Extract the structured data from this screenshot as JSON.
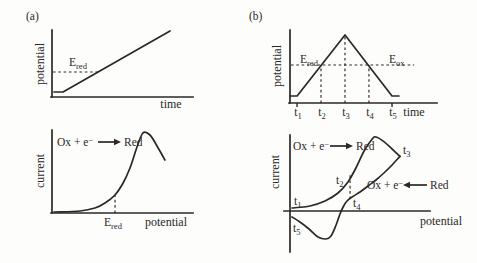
{
  "figure": {
    "panel_a_label": "(a)",
    "panel_b_label": "(b)"
  },
  "colors": {
    "ink": "#2b2826",
    "background": "#fdfdfb"
  },
  "chart_data": [
    {
      "id": "a_top",
      "type": "line",
      "title": "",
      "xlabel": "time",
      "ylabel": "potential",
      "qualitative_axes": true,
      "annotations": {
        "e_red": {
          "base": "E",
          "sub": "red"
        }
      },
      "series": [
        {
          "name": "applied-potential-ramp",
          "smooth": false,
          "x": [
            0.014,
            0.078,
            0.837
          ],
          "y": [
            0.076,
            0.076,
            1.0
          ]
        }
      ],
      "guides": [
        {
          "name": "e-red-level-dashed-line",
          "type": "h",
          "dash": true,
          "y": 0.379,
          "x0": 0.007,
          "x1": 0.326
        }
      ]
    },
    {
      "id": "a_bottom",
      "type": "line",
      "title": "",
      "xlabel": "potential",
      "ylabel": "current",
      "qualitative_axes": true,
      "annotations": {
        "e_red": {
          "base": "E",
          "sub": "red"
        }
      },
      "reaction": {
        "left": "Ox + e",
        "sup": "−",
        "right": "Red",
        "direction": "→"
      },
      "series": [
        {
          "name": "reduction-current-wave",
          "smooth": true,
          "x": [
            0.014,
            0.199,
            0.305,
            0.376,
            0.447,
            0.504,
            0.553,
            0.603,
            0.645,
            0.695,
            0.745,
            0.801
          ],
          "y": [
            0.012,
            0.024,
            0.06,
            0.12,
            0.217,
            0.361,
            0.542,
            0.795,
            0.964,
            0.94,
            0.807,
            0.639
          ]
        }
      ],
      "guides": [
        {
          "name": "e-red-dashed-marker",
          "type": "v",
          "dash": true,
          "x": 0.447,
          "y0": 0.0,
          "y1": 0.217
        }
      ]
    },
    {
      "id": "b_top",
      "type": "line",
      "title": "",
      "xlabel": "time",
      "ylabel": "potential",
      "qualitative_axes": true,
      "annotations": {
        "e_red": {
          "base": "E",
          "sub": "red"
        },
        "e_ox": {
          "base": "E",
          "sub": "ox"
        }
      },
      "x_tick_labels": [
        {
          "base": "t",
          "sub": "1"
        },
        {
          "base": "t",
          "sub": "2"
        },
        {
          "base": "t",
          "sub": "3"
        },
        {
          "base": "t",
          "sub": "4"
        },
        {
          "base": "t",
          "sub": "5"
        }
      ],
      "x_tick_positions": [
        0.048,
        0.211,
        0.374,
        0.537,
        0.694
      ],
      "series": [
        {
          "name": "triangular-potential-sweep",
          "smooth": false,
          "x": [
            0.0,
            0.048,
            0.374,
            0.694,
            0.741
          ],
          "y": [
            0.096,
            0.096,
            0.932,
            0.096,
            0.096
          ]
        }
      ],
      "guides": [
        {
          "name": "e-red-e-ox-level-dashed-line",
          "type": "h",
          "dash": true,
          "y": 0.521,
          "x0": 0.007,
          "x1": 0.845
        },
        {
          "name": "t2-dashed-line",
          "type": "v",
          "dash": true,
          "x": 0.211,
          "y0": 0.0,
          "y1": 0.521
        },
        {
          "name": "t3-dashed-line",
          "type": "v",
          "dash": true,
          "x": 0.374,
          "y0": 0.0,
          "y1": 0.918
        },
        {
          "name": "t4-dashed-line",
          "type": "v",
          "dash": true,
          "x": 0.537,
          "y0": 0.0,
          "y1": 0.521
        },
        {
          "name": "t1-axis-tick",
          "type": "v",
          "dash": false,
          "x": 0.048,
          "y0": 0.0,
          "y1": -0.055
        },
        {
          "name": "t5-axis-tick",
          "type": "v",
          "dash": false,
          "x": 0.694,
          "y0": 0.0,
          "y1": -0.055
        }
      ]
    },
    {
      "id": "b_bottom",
      "type": "line",
      "title": "",
      "xlabel": "potential",
      "ylabel": "current",
      "qualitative_axes": true,
      "y_range": [
        -1,
        1
      ],
      "reaction_forward": {
        "left": "Ox + e",
        "sup": "−",
        "right": "Red",
        "direction": "→"
      },
      "reaction_reverse": {
        "left": "Ox + e",
        "sup": "−",
        "right": "Red",
        "direction": "←"
      },
      "point_labels": {
        "t1": {
          "base": "t",
          "sub": "1"
        },
        "t2": {
          "base": "t",
          "sub": "2"
        },
        "t3": {
          "base": "t",
          "sub": "3"
        },
        "t4": {
          "base": "t",
          "sub": "4"
        },
        "t5": {
          "base": "t",
          "sub": "5"
        }
      },
      "series": [
        {
          "name": "forward-scan-current",
          "smooth": true,
          "x": [
            0.014,
            0.143,
            0.25,
            0.343,
            0.414,
            0.471,
            0.529,
            0.586,
            0.614,
            0.671,
            0.729,
            0.786
          ],
          "y": [
            0.039,
            0.066,
            0.132,
            0.237,
            0.382,
            0.566,
            0.789,
            0.945,
            0.974,
            0.912,
            0.816,
            0.72
          ]
        },
        {
          "name": "reverse-scan-current",
          "smooth": true,
          "x": [
            0.786,
            0.729,
            0.671,
            0.614,
            0.557,
            0.5,
            0.443,
            0.407,
            0.379,
            0.357,
            0.329,
            0.293,
            0.257,
            0.2,
            0.136,
            0.071,
            0.014
          ],
          "y": [
            0.72,
            0.605,
            0.5,
            0.408,
            0.329,
            0.25,
            0.184,
            0.132,
            0.053,
            -0.04,
            -0.184,
            -0.329,
            -0.368,
            -0.342,
            -0.237,
            -0.145,
            -0.079
          ]
        }
      ],
      "guides": [
        {
          "name": "t2-t4-dashed-marker",
          "type": "v",
          "dash": true,
          "x": 0.429,
          "y0": 0.158,
          "y1": 0.487
        }
      ]
    }
  ]
}
